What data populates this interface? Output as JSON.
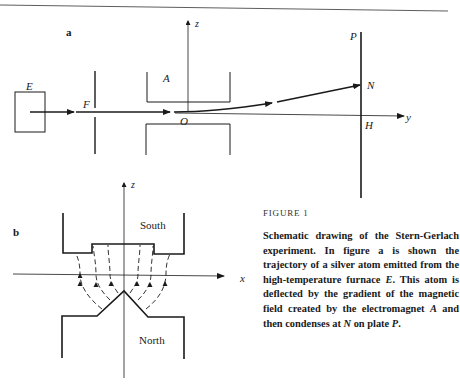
{
  "figure": {
    "number_label": "FIGURE 1",
    "caption_parts": [
      "Schematic drawing of the Stern-Gerlach experiment. In figure ",
      "a",
      " is shown the trajectory of a silver atom emitted from the high-temperature furnace ",
      "E",
      ". This atom is deflected by the gradient of the magnetic field created by the electromagnet ",
      "A",
      " and then condenses at ",
      "N",
      " on plate ",
      "P",
      "."
    ]
  },
  "panel_a": {
    "label": "a",
    "furnace_label": "E",
    "slit_label": "F",
    "magnet_label": "A",
    "origin_label": "O",
    "plate_label": "P",
    "impact_label": "N",
    "axis_foot_label": "H",
    "z_axis_label": "z",
    "y_axis_label": "y"
  },
  "panel_b": {
    "label": "b",
    "z_axis_label": "z",
    "x_axis_label": "x",
    "south_pole_label": "South",
    "north_pole_label": "North"
  }
}
